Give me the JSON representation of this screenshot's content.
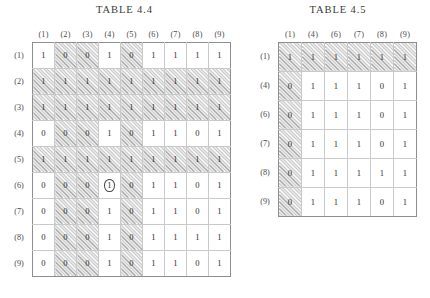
{
  "tables": [
    {
      "id": "44",
      "title": "TABLE 4.4",
      "col_labels": [
        "(1)",
        "(2)",
        "(3)",
        "(4)",
        "(5)",
        "(6)",
        "(7)",
        "(8)",
        "(9)"
      ],
      "row_labels": [
        "(1)",
        "(2)",
        "(3)",
        "(4)",
        "(5)",
        "(6)",
        "(7)",
        "(8)",
        "(9)"
      ],
      "values": [
        [
          "1",
          "0",
          "0",
          "1",
          "0",
          "1",
          "1",
          "1",
          "1"
        ],
        [
          "1",
          "1",
          "1",
          "1",
          "1",
          "1",
          "1",
          "1",
          "1"
        ],
        [
          "1",
          "1",
          "1",
          "1",
          "1",
          "1",
          "1",
          "1",
          "1"
        ],
        [
          "0",
          "0",
          "0",
          "1",
          "0",
          "1",
          "1",
          "0",
          "1"
        ],
        [
          "1",
          "1",
          "1",
          "1",
          "1",
          "1",
          "1",
          "1",
          "1"
        ],
        [
          "0",
          "0",
          "0",
          "1",
          "0",
          "1",
          "1",
          "0",
          "1"
        ],
        [
          "0",
          "0",
          "0",
          "1",
          "0",
          "1",
          "1",
          "0",
          "1"
        ],
        [
          "0",
          "0",
          "0",
          "1",
          "0",
          "1",
          "1",
          "1",
          "1"
        ],
        [
          "0",
          "0",
          "0",
          "1",
          "0",
          "1",
          "1",
          "0",
          "1"
        ]
      ],
      "hatched_rows": [
        1,
        2,
        4
      ],
      "hatched_cols": [
        1,
        2,
        4
      ],
      "circled_cells": [
        [
          5,
          3
        ]
      ]
    },
    {
      "id": "45",
      "title": "TABLE 4.5",
      "col_labels": [
        "(1)",
        "(4)",
        "(6)",
        "(7)",
        "(8)",
        "(9)"
      ],
      "row_labels": [
        "(1)",
        "(4)",
        "(6)",
        "(7)",
        "(8)",
        "(9)"
      ],
      "values": [
        [
          "1",
          "1",
          "1",
          "1",
          "1",
          "1"
        ],
        [
          "0",
          "1",
          "1",
          "1",
          "0",
          "1"
        ],
        [
          "0",
          "1",
          "1",
          "1",
          "0",
          "1"
        ],
        [
          "0",
          "1",
          "1",
          "1",
          "0",
          "1"
        ],
        [
          "0",
          "1",
          "1",
          "1",
          "1",
          "1"
        ],
        [
          "0",
          "1",
          "1",
          "1",
          "0",
          "1"
        ]
      ],
      "hatched_rows": [
        0
      ],
      "hatched_cols": [
        0
      ],
      "circled_cells": []
    }
  ]
}
